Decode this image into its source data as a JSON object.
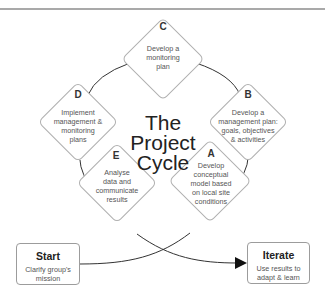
{
  "title": {
    "line1": "The",
    "line2": "Project",
    "line3": "Cycle"
  },
  "steps": {
    "C": {
      "letter": "C",
      "line1": "Develop a",
      "line2": "monitoring",
      "line3": "plan"
    },
    "B": {
      "letter": "B",
      "line1": "Develop a",
      "line2": "management plan:",
      "line3": "goals, objectives",
      "line4": "& activities"
    },
    "A": {
      "letter": "A",
      "line1": "Develop",
      "line2": "conceptual",
      "line3": "model based",
      "line4": "on local site",
      "line5": "conditions"
    },
    "E": {
      "letter": "E",
      "line1": "Analyse",
      "line2": "data and",
      "line3": "communicate",
      "line4": "results"
    },
    "D": {
      "letter": "D",
      "line1": "Implement",
      "line2": "management &",
      "line3": "monitoring",
      "line4": "plans"
    }
  },
  "start": {
    "title": "Start",
    "line1": "Clarify group's",
    "line2": "mission"
  },
  "iterate": {
    "title": "Iterate",
    "line1": "Use results to",
    "line2": "adapt & learn"
  },
  "colors": {
    "line": "#333333",
    "diamond_border": "#b0b0b0",
    "text": "#555555",
    "top_rule": "#a9a9a9"
  }
}
